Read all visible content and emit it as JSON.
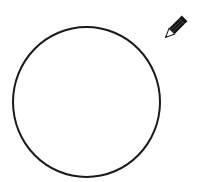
{
  "canvas": {
    "background": "#ffffff",
    "shapes": [
      {
        "type": "circle",
        "stroke": "#1a1a1a",
        "fill": "none"
      }
    ]
  },
  "tool": {
    "icon": "pencil-icon",
    "body_color": "#111111",
    "tip_color": "#ffffff"
  }
}
